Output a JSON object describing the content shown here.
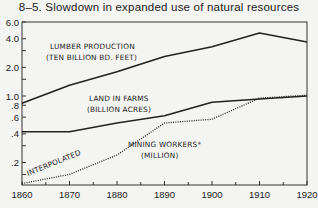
{
  "chart_data": {
    "type": "line",
    "title": "8–5.  Slowdown in expanded use of natural resources",
    "xlabel": "",
    "ylabel": "",
    "x": [
      1860,
      1870,
      1880,
      1890,
      1900,
      1910,
      1920
    ],
    "xlim": [
      1860,
      1920
    ],
    "ylim": [
      0.116,
      6.0
    ],
    "yscale": "log",
    "grid": false,
    "x_tick_labels": [
      "1860",
      "1870",
      "1880",
      "1890",
      "1900",
      "1910",
      "1920"
    ],
    "y_ticks": [
      {
        "value": 6.0,
        "label": "6.0"
      },
      {
        "value": 4.0,
        "label": "4.0"
      },
      {
        "value": 2.0,
        "label": "2.0"
      },
      {
        "value": 1.0,
        "label": "1.0"
      },
      {
        "value": 0.8,
        "label": ".8"
      },
      {
        "value": 0.6,
        "label": ".6"
      },
      {
        "value": 0.4,
        "label": ".4"
      },
      {
        "value": 0.2,
        "label": ".2"
      }
    ],
    "series": [
      {
        "name": "Lumber production (ten billion bd. feet)",
        "style": "solid",
        "values": [
          0.84,
          1.3,
          1.8,
          2.6,
          3.3,
          4.6,
          3.7
        ]
      },
      {
        "name": "Land in farms (billion acres)",
        "style": "solid",
        "values": [
          0.42,
          0.42,
          0.52,
          0.62,
          0.86,
          0.93,
          1.0
        ]
      },
      {
        "name": "Mining workers* (million)",
        "style": "dotted",
        "values": [
          0.12,
          0.15,
          0.24,
          0.52,
          0.57,
          0.95,
          1.02
        ]
      }
    ],
    "annotations": [
      {
        "text": "LUMBER PRODUCTION",
        "series": 0
      },
      {
        "text": "(TEN BILLION BD. FEET)",
        "series": 0
      },
      {
        "text": "LAND IN FARMS",
        "series": 1
      },
      {
        "text": "(BILLION ACRES)",
        "series": 1
      },
      {
        "text": "MINING WORKERS*",
        "series": 2
      },
      {
        "text": "(MILLION)",
        "series": 2
      },
      {
        "text": "INTERPOLATED",
        "series": 2
      }
    ]
  }
}
